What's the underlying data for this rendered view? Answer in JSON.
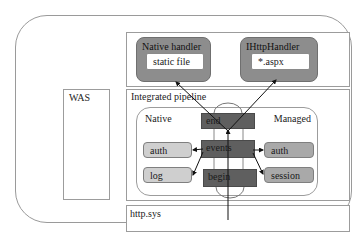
{
  "diagram": {
    "was": {
      "label": "WAS"
    },
    "handlers": {
      "native": {
        "title": "Native handler",
        "item": "static file"
      },
      "managed": {
        "title": "IHttpHandler",
        "item": "*.aspx"
      }
    },
    "pipeline": {
      "title": "Integrated pipeline",
      "native_label": "Native",
      "managed_label": "Managed",
      "stages": {
        "end": "end",
        "events": "events",
        "begin": "begin"
      },
      "native_modules": [
        "auth",
        "log"
      ],
      "managed_modules": [
        "auth",
        "session"
      ]
    },
    "kernel": {
      "label": "http.sys"
    }
  }
}
